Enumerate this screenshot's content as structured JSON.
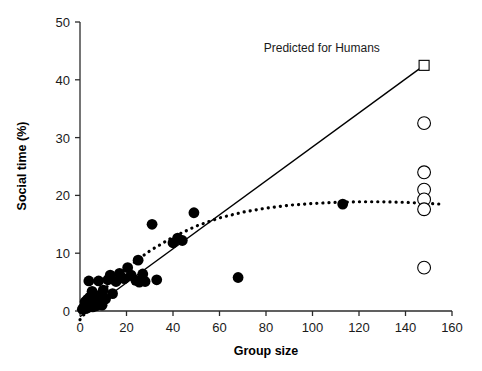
{
  "chart_data": {
    "type": "scatter",
    "title": "",
    "xlabel": "Group size",
    "ylabel": "Social time (%)",
    "xlim": [
      0,
      160
    ],
    "ylim": [
      0,
      50
    ],
    "xticks": [
      0,
      20,
      40,
      60,
      80,
      100,
      120,
      140,
      160
    ],
    "yticks": [
      0,
      10,
      20,
      30,
      40,
      50
    ],
    "grid": false,
    "legend": "none",
    "annotations": [
      {
        "text": "Predicted for Humans",
        "x": 104,
        "y": 45.5,
        "marker": "open-square",
        "marker_x": 148,
        "marker_y": 42.5
      }
    ],
    "series": [
      {
        "name": "Primate species (observed)",
        "marker": "filled-circle",
        "color": "#000000",
        "points": [
          [
            1.0,
            0.3
          ],
          [
            1.5,
            0.5
          ],
          [
            2.0,
            0.8
          ],
          [
            2.2,
            1.6
          ],
          [
            2.5,
            0.4
          ],
          [
            3.0,
            1.2
          ],
          [
            3.2,
            2.0
          ],
          [
            3.5,
            0.6
          ],
          [
            3.8,
            5.2
          ],
          [
            4.0,
            1.0
          ],
          [
            4.2,
            2.4
          ],
          [
            4.5,
            0.9
          ],
          [
            5.0,
            1.4
          ],
          [
            5.2,
            3.4
          ],
          [
            5.5,
            0.7
          ],
          [
            5.8,
            2.2
          ],
          [
            6.0,
            1.1
          ],
          [
            6.5,
            1.8
          ],
          [
            7.0,
            0.9
          ],
          [
            7.2,
            2.6
          ],
          [
            7.5,
            1.3
          ],
          [
            8.0,
            5.2
          ],
          [
            8.5,
            1.7
          ],
          [
            9.0,
            2.8
          ],
          [
            9.5,
            1.0
          ],
          [
            10.0,
            3.6
          ],
          [
            11.0,
            2.1
          ],
          [
            12.0,
            5.4
          ],
          [
            13.0,
            6.2
          ],
          [
            14.0,
            3.0
          ],
          [
            15.5,
            5.1
          ],
          [
            17.0,
            6.5
          ],
          [
            19.0,
            5.6
          ],
          [
            20.5,
            7.5
          ],
          [
            22.0,
            6.2
          ],
          [
            24.0,
            5.3
          ],
          [
            25.0,
            8.8
          ],
          [
            25.5,
            5.0
          ],
          [
            27.0,
            6.4
          ],
          [
            28.0,
            5.1
          ],
          [
            31.0,
            15.0
          ],
          [
            33.0,
            5.4
          ],
          [
            40.0,
            11.8
          ],
          [
            42.0,
            12.6
          ],
          [
            44.0,
            12.2
          ],
          [
            49.0,
            17.0
          ],
          [
            68.0,
            5.8
          ],
          [
            113.0,
            18.5
          ]
        ]
      },
      {
        "name": "Human data points",
        "marker": "open-circle",
        "color": "#000000",
        "points": [
          [
            148,
            32.5
          ],
          [
            148,
            24.0
          ],
          [
            148,
            21.0
          ],
          [
            148,
            19.3
          ],
          [
            148,
            17.6
          ],
          [
            148,
            7.5
          ]
        ]
      },
      {
        "name": "Predicted for Humans",
        "marker": "open-square",
        "color": "#000000",
        "points": [
          [
            148,
            42.5
          ]
        ]
      }
    ],
    "lines": [
      {
        "name": "Linear regression (solid)",
        "style": "solid",
        "color": "#000000",
        "points": [
          [
            0,
            -1.0
          ],
          [
            148,
            42.5
          ]
        ]
      },
      {
        "name": "Curvilinear fit (dotted)",
        "style": "dotted",
        "color": "#000000",
        "points": [
          [
            0,
            -1.5
          ],
          [
            10,
            3.6
          ],
          [
            20,
            7.4
          ],
          [
            30,
            10.4
          ],
          [
            40,
            12.8
          ],
          [
            50,
            14.7
          ],
          [
            60,
            16.1
          ],
          [
            70,
            17.1
          ],
          [
            80,
            17.8
          ],
          [
            90,
            18.3
          ],
          [
            100,
            18.6
          ],
          [
            110,
            18.8
          ],
          [
            120,
            18.9
          ],
          [
            130,
            18.9
          ],
          [
            140,
            18.8
          ],
          [
            150,
            18.6
          ],
          [
            155,
            18.5
          ]
        ]
      }
    ]
  },
  "axes": {
    "x_title": "Group size",
    "y_title": "Social time (%)",
    "x_tick_labels": [
      "0",
      "20",
      "40",
      "60",
      "80",
      "100",
      "120",
      "140",
      "160"
    ],
    "y_tick_labels": [
      "0",
      "10",
      "20",
      "30",
      "40",
      "50"
    ]
  },
  "annotation_label": "Predicted for Humans",
  "colors": {
    "axis": "#2b2b2b",
    "marker": "#000000",
    "background": "#ffffff"
  }
}
